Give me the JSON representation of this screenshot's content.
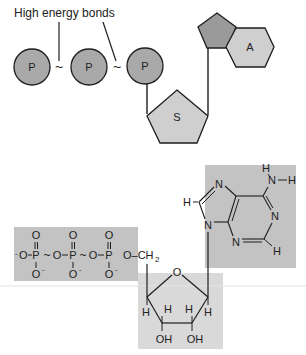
{
  "schematic": {
    "annotation": "High energy  bonds",
    "phosphate_label": "P",
    "sugar_label": "S",
    "base_label": "A",
    "bond_symbol": "~"
  },
  "structure": {
    "phosphates": {
      "o_top": "O",
      "o_minus": "O",
      "minus": "-",
      "p": "P",
      "o": "O",
      "tilde": "~",
      "dash": "–",
      "och2": "O–CH",
      "sub2": "2"
    },
    "adenine": {
      "n": "N",
      "h": "H",
      "nh2_h": "H"
    },
    "ribose": {
      "o": "O",
      "h": "H",
      "oh": "OH"
    }
  },
  "colors": {
    "circle_fill": "#a9a9a9",
    "pentagon_dark": "#9a9a9a",
    "shape_light": "#cfcfcf",
    "box_fill": "#c3c3c3",
    "box_light": "#d9d9d9",
    "stroke": "#1e1e1e"
  }
}
